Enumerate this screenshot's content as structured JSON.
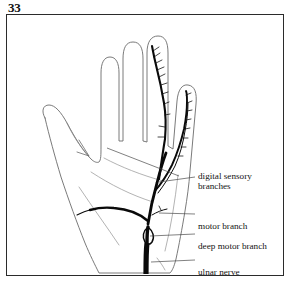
{
  "figure": {
    "number": "33",
    "caption_visible": false
  },
  "colors": {
    "frame_border": "#2b2b2b",
    "background": "#ffffff",
    "hand_outline": "#6b6b6b",
    "palm_crease": "#8a8a8a",
    "nerve": "#0a0a0a",
    "leader_line": "#4a4a4a",
    "text": "#141414"
  },
  "diagram": {
    "view": "palmar",
    "structures": [
      {
        "name": "ulnar-nerve",
        "kind": "nerve-trunk",
        "weight": "thick"
      },
      {
        "name": "deep-motor-branch",
        "kind": "nerve-branch",
        "weight": "medium"
      },
      {
        "name": "motor-branch",
        "kind": "nerve-branch",
        "weight": "medium"
      },
      {
        "name": "digital-sensory-branches",
        "kind": "nerve-branch",
        "weight": "medium"
      }
    ]
  },
  "labels": [
    {
      "id": "digital-sensory-branches",
      "line1": "digital sensory",
      "line2": "branches"
    },
    {
      "id": "motor-branch",
      "text": "motor branch"
    },
    {
      "id": "deep-motor-branch",
      "text": "deep motor branch"
    },
    {
      "id": "ulnar-nerve",
      "text": "ulnar nerve"
    }
  ]
}
